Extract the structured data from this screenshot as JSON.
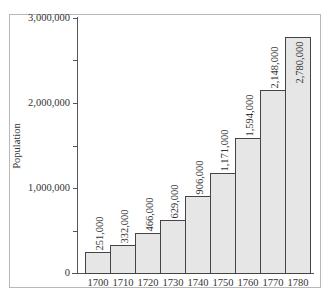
{
  "chart_data": {
    "type": "bar",
    "title": "",
    "xlabel": "",
    "ylabel": "Population",
    "ylim": [
      0,
      3000000
    ],
    "yticks": [
      0,
      500000,
      1000000,
      1500000,
      2000000,
      2500000,
      3000000
    ],
    "ytick_labels": [
      "0",
      "",
      "1,000,000",
      "",
      "2,000,000",
      "",
      "3,000,000"
    ],
    "categories": [
      "1700",
      "1710",
      "1720",
      "1730",
      "1740",
      "1750",
      "1760",
      "1770",
      "1780"
    ],
    "values": [
      251000,
      332000,
      466000,
      629000,
      906000,
      1171000,
      1594000,
      2148000,
      2780000
    ],
    "value_labels": [
      "251,000",
      "332,000",
      "466,000",
      "629,000",
      "906,000",
      "1,171,000",
      "1,594,000",
      "2,148,000",
      "2,780,000"
    ],
    "bar_color": "#e6e6e6",
    "grid": false,
    "legend": null
  }
}
